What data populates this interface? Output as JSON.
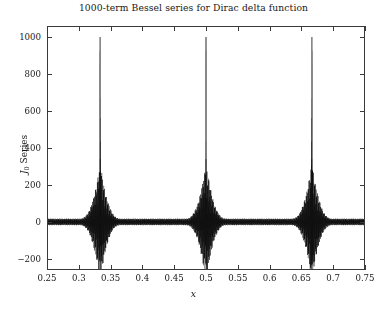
{
  "chart_data": {
    "type": "line",
    "title": "1000-term Bessel series for Dirac delta function",
    "xlabel": "x",
    "ylabel": "J_0 Series",
    "ylabel_base": "J",
    "ylabel_sub": "0",
    "ylabel_rest": " Series",
    "xlim": [
      0.25,
      0.75
    ],
    "ylim": [
      -260,
      1060
    ],
    "xticks": [
      0.25,
      0.3,
      0.35,
      0.4,
      0.45,
      0.5,
      0.55,
      0.6,
      0.65,
      0.7,
      0.75
    ],
    "xticklabels": [
      "0.25",
      "0.3",
      "0.35",
      "0.4",
      "0.45",
      "0.5",
      "0.55",
      "0.6",
      "0.65",
      "0.7",
      "0.75"
    ],
    "yticks": [
      -200,
      0,
      200,
      400,
      600,
      800,
      1000
    ],
    "yticklabels": [
      "-200",
      "0",
      "200",
      "400",
      "600",
      "800",
      "1000"
    ],
    "grid": false,
    "legend": false,
    "line_color": "#101010",
    "frame_color": "#3a3a3a",
    "background": "#ffffff",
    "n_terms": 1000,
    "spikes": [
      {
        "x": 0.3335,
        "peak": 1000,
        "trough": -215
      },
      {
        "x": 0.5,
        "peak": 1000,
        "trough": -230
      },
      {
        "x": 0.6665,
        "peak": 1000,
        "trough": -235
      }
    ],
    "envelope_halfwidth_x": 0.033,
    "baseline_band_amplitude": 18
  }
}
